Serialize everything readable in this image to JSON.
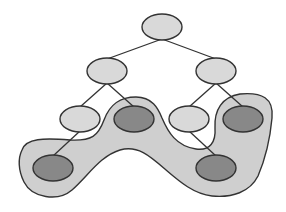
{
  "diagram": {
    "type": "tree-with-highlighted-region",
    "colors": {
      "background": "#ffffff",
      "node_light": "#d9d9d9",
      "node_dark": "#888888",
      "region_fill": "#cfcfcf",
      "stroke": "#333333"
    },
    "nodes": [
      {
        "id": "n0",
        "cx": 162,
        "cy": 27,
        "rx": 20,
        "ry": 13,
        "shade": "light",
        "level": 0
      },
      {
        "id": "n1",
        "cx": 107,
        "cy": 71,
        "rx": 20,
        "ry": 13,
        "shade": "light",
        "level": 1
      },
      {
        "id": "n2",
        "cx": 216,
        "cy": 71,
        "rx": 20,
        "ry": 13,
        "shade": "light",
        "level": 1
      },
      {
        "id": "n3",
        "cx": 80,
        "cy": 119,
        "rx": 20,
        "ry": 13,
        "shade": "light",
        "level": 2
      },
      {
        "id": "n4",
        "cx": 134,
        "cy": 119,
        "rx": 20,
        "ry": 13,
        "shade": "dark",
        "level": 2
      },
      {
        "id": "n5",
        "cx": 189,
        "cy": 119,
        "rx": 20,
        "ry": 13,
        "shade": "light",
        "level": 2
      },
      {
        "id": "n6",
        "cx": 243,
        "cy": 119,
        "rx": 20,
        "ry": 13,
        "shade": "dark",
        "level": 2
      },
      {
        "id": "n7",
        "cx": 53,
        "cy": 168,
        "rx": 20,
        "ry": 13,
        "shade": "dark",
        "level": 3
      },
      {
        "id": "n8",
        "cx": 216,
        "cy": 168,
        "rx": 20,
        "ry": 13,
        "shade": "dark",
        "level": 3
      }
    ],
    "edges": [
      [
        "n0",
        "n1"
      ],
      [
        "n0",
        "n2"
      ],
      [
        "n1",
        "n3"
      ],
      [
        "n1",
        "n4"
      ],
      [
        "n2",
        "n5"
      ],
      [
        "n2",
        "n6"
      ],
      [
        "n3",
        "n7"
      ],
      [
        "n5",
        "n8"
      ]
    ],
    "highlighted_region": {
      "contains": [
        "n4",
        "n6",
        "n7",
        "n8"
      ],
      "description": "Shaded blob enclosing the dark nodes"
    }
  }
}
